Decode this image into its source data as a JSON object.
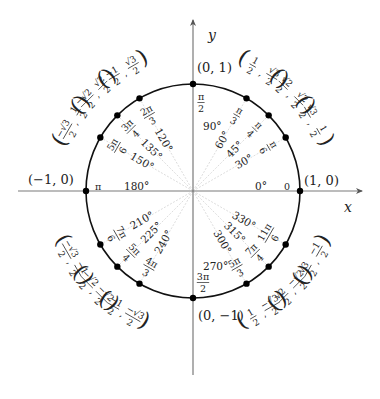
{
  "diagram": {
    "axes": {
      "x_label": "x",
      "y_label": "y"
    },
    "axis_points": [
      {
        "name": "right",
        "label": "(1, 0)",
        "angle_deg": 0
      },
      {
        "name": "top",
        "label": "(0, 1)",
        "angle_deg": 90
      },
      {
        "name": "left",
        "label": "(−1, 0)",
        "angle_deg": 180
      },
      {
        "name": "bottom",
        "label": "(0, −1)",
        "angle_deg": 270
      }
    ],
    "axis_radian_labels": [
      {
        "angle_deg": 0,
        "radian": {
          "whole": "0"
        },
        "degree": "0°"
      },
      {
        "angle_deg": 90,
        "radian": {
          "num": "π",
          "den": "2"
        },
        "degree": "90°"
      },
      {
        "angle_deg": 180,
        "radian": {
          "whole": "π"
        },
        "degree": "180°"
      },
      {
        "angle_deg": 270,
        "radian": {
          "num": "3π",
          "den": "2"
        },
        "degree": "270°"
      }
    ],
    "angles": [
      {
        "angle_deg": 30,
        "degree": "30°",
        "radian": {
          "num": "π",
          "den": "6"
        },
        "coord": {
          "x": {
            "num": "√3",
            "den": "2"
          },
          "y": {
            "num": "1",
            "den": "2"
          }
        }
      },
      {
        "angle_deg": 45,
        "degree": "45°",
        "radian": {
          "num": "π",
          "den": "4"
        },
        "coord": {
          "x": {
            "num": "√2",
            "den": "2"
          },
          "y": {
            "num": "√2",
            "den": "2"
          }
        }
      },
      {
        "angle_deg": 60,
        "degree": "60°",
        "radian": {
          "num": "π",
          "den": "3"
        },
        "coord": {
          "x": {
            "num": "1",
            "den": "2"
          },
          "y": {
            "num": "√3",
            "den": "2"
          }
        }
      },
      {
        "angle_deg": 120,
        "degree": "120°",
        "radian": {
          "num": "2π",
          "den": "3"
        },
        "coord": {
          "x": {
            "num": "−1",
            "den": "2"
          },
          "y": {
            "num": "√3",
            "den": "2"
          }
        }
      },
      {
        "angle_deg": 135,
        "degree": "135°",
        "radian": {
          "num": "3π",
          "den": "4"
        },
        "coord": {
          "x": {
            "num": "−√2",
            "den": "2"
          },
          "y": {
            "num": "√2",
            "den": "2"
          }
        }
      },
      {
        "angle_deg": 150,
        "degree": "150°",
        "radian": {
          "num": "5π",
          "den": "6"
        },
        "coord": {
          "x": {
            "num": "−√3",
            "den": "2"
          },
          "y": {
            "num": "1",
            "den": "2"
          }
        }
      },
      {
        "angle_deg": 210,
        "degree": "210°",
        "radian": {
          "num": "7π",
          "den": "6"
        },
        "coord": {
          "x": {
            "num": "−√3",
            "den": "2"
          },
          "y": {
            "num": "−1",
            "den": "2"
          }
        }
      },
      {
        "angle_deg": 225,
        "degree": "225°",
        "radian": {
          "num": "5π",
          "den": "4"
        },
        "coord": {
          "x": {
            "num": "−√2",
            "den": "2"
          },
          "y": {
            "num": "−√2",
            "den": "2"
          }
        }
      },
      {
        "angle_deg": 240,
        "degree": "240°",
        "radian": {
          "num": "4π",
          "den": "3"
        },
        "coord": {
          "x": {
            "num": "−1",
            "den": "2"
          },
          "y": {
            "num": "−√3",
            "den": "2"
          }
        }
      },
      {
        "angle_deg": 300,
        "degree": "300°",
        "radian": {
          "num": "5π",
          "den": "3"
        },
        "coord": {
          "x": {
            "num": "1",
            "den": "2"
          },
          "y": {
            "num": "−√3",
            "den": "2"
          }
        }
      },
      {
        "angle_deg": 315,
        "degree": "315°",
        "radian": {
          "num": "7π",
          "den": "4"
        },
        "coord": {
          "x": {
            "num": "√2",
            "den": "2"
          },
          "y": {
            "num": "−√2",
            "den": "2"
          }
        }
      },
      {
        "angle_deg": 330,
        "degree": "330°",
        "radian": {
          "num": "11π",
          "den": "6"
        },
        "coord": {
          "x": {
            "num": "√3",
            "den": "2"
          },
          "y": {
            "num": "−1",
            "den": "2"
          }
        }
      }
    ],
    "colors": {
      "circle": "#111111",
      "axes": "#7a7a7a",
      "guides": "#d9d9d9",
      "points": "#000000",
      "text": "#222222"
    }
  }
}
